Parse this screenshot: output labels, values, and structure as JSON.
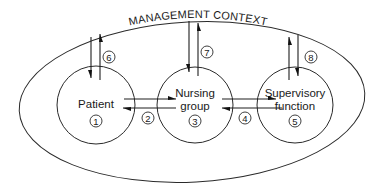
{
  "diagram": {
    "context_label": "MANAGEMENT CONTEXT",
    "nodes": [
      {
        "id": "patient",
        "lines": [
          "Patient"
        ],
        "number": "1"
      },
      {
        "id": "nursing-group",
        "lines": [
          "Nursing",
          "group"
        ],
        "number": "3"
      },
      {
        "id": "supervisory-function",
        "lines": [
          "Supervisory",
          "function"
        ],
        "number": "5"
      }
    ],
    "connections": [
      {
        "number": "2",
        "between": [
          "patient",
          "nursing-group"
        ],
        "direction": "bidirectional"
      },
      {
        "number": "4",
        "between": [
          "nursing-group",
          "supervisory-function"
        ],
        "direction": "bidirectional"
      },
      {
        "number": "6",
        "between": [
          "management-context",
          "patient"
        ],
        "direction": "bidirectional"
      },
      {
        "number": "7",
        "between": [
          "management-context",
          "nursing-group"
        ],
        "direction": "bidirectional"
      },
      {
        "number": "8",
        "between": [
          "management-context",
          "supervisory-function"
        ],
        "direction": "bidirectional"
      }
    ]
  },
  "colors": {
    "stroke": "#2a2a2a",
    "text": "#1a1a1a",
    "background": "#ffffff"
  }
}
